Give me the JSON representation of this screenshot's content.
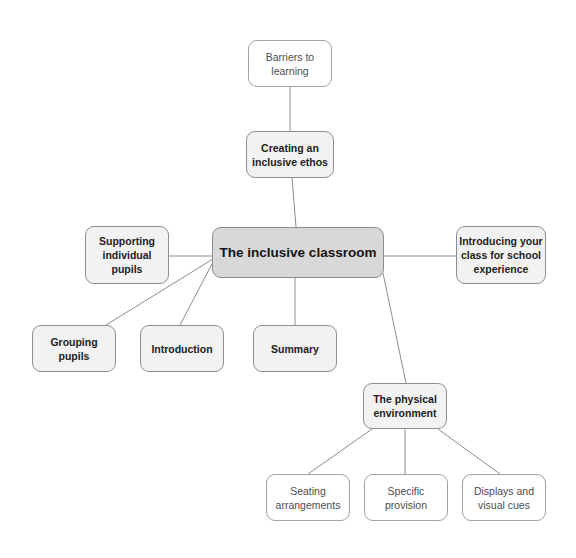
{
  "diagram": {
    "kind": "mind-map",
    "title": "The inclusive classroom",
    "background_color": "#ffffff",
    "edge_color": "#8a8d90",
    "styles": {
      "center_fill": "#d8d8d8",
      "branch_fill": "#f2f2f2",
      "leaf_fill": "#ffffff",
      "border_color": "#8d9093",
      "text_color": "#1d1d1d"
    }
  },
  "nodes": [
    {
      "id": "barriers",
      "label": "Barriers to\nlearning",
      "style": "plain",
      "x": 248,
      "y": 40,
      "w": 84,
      "h": 47
    },
    {
      "id": "ethos",
      "label": "Creating an\ninclusive ethos",
      "style": "branch",
      "x": 246,
      "y": 131,
      "w": 88,
      "h": 47
    },
    {
      "id": "center",
      "label": "The inclusive classroom",
      "style": "center",
      "x": 212,
      "y": 227,
      "w": 172,
      "h": 51
    },
    {
      "id": "supporting",
      "label": "Supporting\nindividual\npupils",
      "style": "branch",
      "x": 85,
      "y": 226,
      "w": 84,
      "h": 58
    },
    {
      "id": "introducing",
      "label": "Introducing your\nclass for school\nexperience",
      "style": "branch",
      "x": 456,
      "y": 226,
      "w": 90,
      "h": 58
    },
    {
      "id": "grouping",
      "label": "Grouping\npupils",
      "style": "branch",
      "x": 32,
      "y": 325,
      "w": 84,
      "h": 47
    },
    {
      "id": "introduction",
      "label": "Introduction",
      "style": "branch",
      "x": 140,
      "y": 325,
      "w": 84,
      "h": 47
    },
    {
      "id": "summary",
      "label": "Summary",
      "style": "branch",
      "x": 253,
      "y": 325,
      "w": 84,
      "h": 47
    },
    {
      "id": "physical",
      "label": "The physical\nenvironment",
      "style": "branch",
      "x": 363,
      "y": 383,
      "w": 84,
      "h": 46
    },
    {
      "id": "seating",
      "label": "Seating\narrangements",
      "style": "plain",
      "x": 266,
      "y": 474,
      "w": 84,
      "h": 47
    },
    {
      "id": "specific",
      "label": "Specific\nprovision",
      "style": "plain",
      "x": 364,
      "y": 474,
      "w": 84,
      "h": 47
    },
    {
      "id": "displays",
      "label": "Displays and\nvisual cues",
      "style": "plain",
      "x": 462,
      "y": 474,
      "w": 84,
      "h": 47
    }
  ],
  "edges": [
    {
      "from": "barriers",
      "to": "ethos",
      "x1": 290,
      "y1": 87,
      "x2": 290,
      "y2": 131
    },
    {
      "from": "ethos",
      "to": "center",
      "x1": 292,
      "y1": 178,
      "x2": 296,
      "y2": 227
    },
    {
      "from": "center",
      "to": "supporting",
      "x1": 212,
      "y1": 256,
      "x2": 169,
      "y2": 256
    },
    {
      "from": "center",
      "to": "introducing",
      "x1": 384,
      "y1": 256,
      "x2": 456,
      "y2": 256
    },
    {
      "from": "center",
      "to": "grouping",
      "x1": 213,
      "y1": 259,
      "x2": 106,
      "y2": 325
    },
    {
      "from": "center",
      "to": "introduction",
      "x1": 214,
      "y1": 260,
      "x2": 180,
      "y2": 325
    },
    {
      "from": "center",
      "to": "summary",
      "x1": 295,
      "y1": 278,
      "x2": 295,
      "y2": 325
    },
    {
      "from": "center",
      "to": "physical",
      "x1": 383,
      "y1": 273,
      "x2": 406,
      "y2": 383
    },
    {
      "from": "physical",
      "to": "seating",
      "x1": 372,
      "y1": 429,
      "x2": 308,
      "y2": 474
    },
    {
      "from": "physical",
      "to": "specific",
      "x1": 405,
      "y1": 429,
      "x2": 405,
      "y2": 474
    },
    {
      "from": "physical",
      "to": "displays",
      "x1": 438,
      "y1": 429,
      "x2": 500,
      "y2": 474
    }
  ]
}
